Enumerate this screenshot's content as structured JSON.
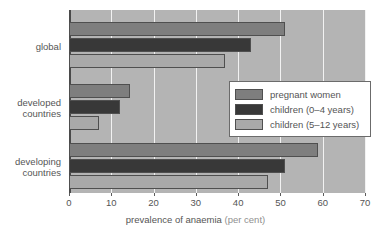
{
  "chart_data": {
    "type": "bar",
    "orientation": "horizontal",
    "title": "",
    "xlabel": "prevalence of anaemia (per cent)",
    "xlabel_main": "prevalence of anaemia",
    "xlabel_unit": "(per cent)",
    "ylabel": "",
    "xlim": [
      0,
      70
    ],
    "xticks": [
      0,
      10,
      20,
      30,
      40,
      50,
      60,
      70
    ],
    "xtick_labels": [
      "0",
      "10",
      "20",
      "30",
      "40",
      "50",
      "60",
      "70"
    ],
    "grid": true,
    "grid_axis": "x",
    "legend_position": "center-right",
    "categories": [
      "global",
      "developed countries",
      "developing countries"
    ],
    "category_lines": [
      [
        "global"
      ],
      [
        "developed",
        "countries"
      ],
      [
        "developing",
        "countries"
      ]
    ],
    "series": [
      {
        "name": "pregnant women",
        "color": "#7e7e7e",
        "values": [
          51,
          14.5,
          59
        ]
      },
      {
        "name": "children (0–4 years)",
        "color": "#383838",
        "values": [
          43,
          12,
          51
        ]
      },
      {
        "name": "children (5–12 years)",
        "color": "#a9a9a9",
        "values": [
          37,
          7,
          47
        ]
      }
    ]
  },
  "legend": {
    "items": [
      {
        "label": "pregnant women",
        "color": "#7e7e7e"
      },
      {
        "label": "children (0–4 years)",
        "color": "#383838"
      },
      {
        "label": "children (5–12 years)",
        "color": "#a9a9a9"
      }
    ]
  },
  "colors": {
    "plot_background": "#b4b4b4",
    "gridline": "#f2f2f2",
    "axis": "#4a4a4a",
    "text": "#555555",
    "page_background": "#ffffff"
  }
}
